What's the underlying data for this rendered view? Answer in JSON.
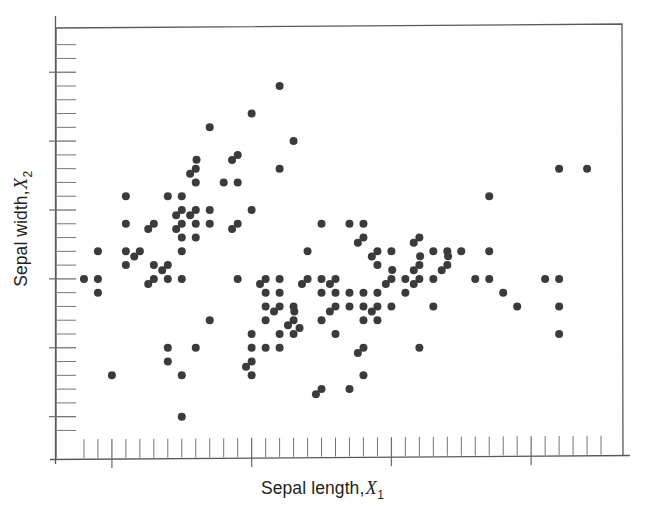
{
  "figure": {
    "background_color": "#ffffff",
    "frame_color": "#58595b",
    "point_color": "#3b3b3d",
    "tick_color": "#6d6e70",
    "text_color": "#231f20"
  },
  "labels": {
    "x_axis_text": "Sepal length,",
    "x_axis_var": "X",
    "x_axis_sub": "1",
    "y_axis_text": "Sepal width,",
    "y_axis_var": "X",
    "y_axis_sub": "2"
  },
  "chart_data": {
    "type": "scatter",
    "title": "",
    "xlabel": "Sepal length, X1",
    "ylabel": "Sepal width, X2",
    "grid": false,
    "legend": "none",
    "axis_tick_labels_shown": false,
    "xlim": [
      4.1,
      8.15
    ],
    "ylim": [
      1.7,
      4.85
    ],
    "x_major_tick_values": [
      4.5,
      5.5,
      6.5,
      7.5
    ],
    "x_minor_tick_step": 0.1,
    "y_major_tick_values": [
      2.0,
      2.5,
      3.0,
      3.5,
      4.0,
      4.5
    ],
    "y_minor_tick_step": 0.1,
    "marker": "filled-circle",
    "marker_size_px": 8,
    "n_points": 150,
    "x": [
      5.1,
      4.9,
      4.7,
      4.6,
      5.0,
      5.4,
      4.6,
      5.0,
      4.4,
      4.9,
      5.4,
      4.8,
      4.8,
      4.3,
      5.8,
      5.7,
      5.4,
      5.1,
      5.7,
      5.1,
      5.4,
      5.1,
      4.6,
      5.1,
      4.8,
      5.0,
      5.0,
      5.2,
      5.2,
      4.7,
      4.8,
      5.4,
      5.2,
      5.5,
      4.9,
      5.0,
      5.5,
      4.9,
      4.4,
      5.1,
      5.0,
      4.5,
      4.4,
      5.0,
      5.1,
      4.8,
      5.1,
      4.6,
      5.3,
      5.0,
      7.0,
      6.4,
      6.9,
      5.5,
      6.5,
      5.7,
      6.3,
      4.9,
      6.6,
      5.2,
      5.0,
      5.9,
      6.0,
      6.1,
      5.6,
      6.7,
      5.6,
      5.8,
      6.2,
      5.6,
      5.9,
      6.1,
      6.3,
      6.1,
      6.4,
      6.6,
      6.8,
      6.7,
      6.0,
      5.7,
      5.5,
      5.5,
      5.8,
      6.0,
      5.4,
      6.0,
      6.7,
      6.3,
      5.6,
      5.5,
      5.5,
      6.1,
      5.8,
      5.0,
      5.6,
      5.7,
      5.7,
      6.2,
      5.1,
      5.7,
      6.3,
      5.8,
      7.1,
      6.3,
      6.5,
      7.6,
      4.9,
      7.3,
      6.7,
      7.2,
      6.5,
      6.4,
      6.8,
      5.7,
      5.8,
      6.4,
      6.5,
      7.7,
      7.7,
      6.0,
      6.9,
      5.6,
      7.7,
      6.3,
      6.7,
      7.2,
      6.2,
      6.1,
      6.4,
      7.2,
      7.4,
      7.9,
      6.4,
      6.3,
      6.1,
      7.7,
      6.3,
      6.4,
      6.0,
      6.9,
      6.7,
      6.9,
      5.8,
      6.8,
      6.7,
      6.7,
      6.3,
      6.5,
      6.2,
      5.9
    ],
    "y": [
      3.5,
      3.0,
      3.2,
      3.1,
      3.6,
      3.9,
      3.4,
      3.4,
      2.9,
      3.1,
      3.7,
      3.4,
      3.0,
      3.0,
      4.0,
      4.4,
      3.9,
      3.5,
      3.8,
      3.8,
      3.4,
      3.7,
      3.6,
      3.3,
      3.4,
      3.0,
      3.4,
      3.5,
      3.4,
      3.2,
      3.1,
      3.4,
      4.1,
      4.2,
      3.1,
      3.2,
      3.5,
      3.6,
      3.0,
      3.4,
      3.5,
      2.3,
      3.2,
      3.5,
      3.8,
      3.0,
      3.8,
      3.2,
      3.7,
      3.3,
      3.2,
      3.2,
      3.1,
      2.3,
      2.8,
      2.8,
      3.3,
      2.4,
      2.9,
      2.7,
      2.0,
      3.0,
      2.2,
      2.9,
      2.9,
      3.1,
      3.0,
      2.7,
      2.2,
      2.5,
      3.2,
      2.8,
      2.5,
      2.8,
      2.9,
      3.0,
      2.8,
      3.0,
      2.9,
      2.6,
      2.4,
      2.4,
      2.7,
      2.7,
      3.0,
      3.4,
      3.1,
      2.3,
      3.0,
      2.5,
      2.6,
      3.0,
      2.6,
      2.3,
      2.7,
      3.0,
      2.9,
      2.9,
      2.5,
      2.8,
      3.3,
      2.7,
      3.0,
      2.9,
      3.0,
      3.0,
      2.5,
      2.9,
      2.5,
      3.6,
      3.2,
      2.7,
      3.0,
      2.5,
      2.8,
      3.2,
      3.0,
      3.8,
      2.6,
      2.2,
      3.2,
      2.8,
      2.8,
      2.7,
      3.3,
      3.2,
      2.8,
      3.0,
      2.8,
      3.0,
      2.8,
      3.8,
      2.8,
      2.8,
      2.6,
      3.0,
      3.4,
      3.1,
      3.0,
      3.1,
      3.1,
      3.1,
      2.7,
      3.2,
      3.3,
      3.0,
      2.5,
      3.0,
      3.4,
      3.0
    ]
  }
}
